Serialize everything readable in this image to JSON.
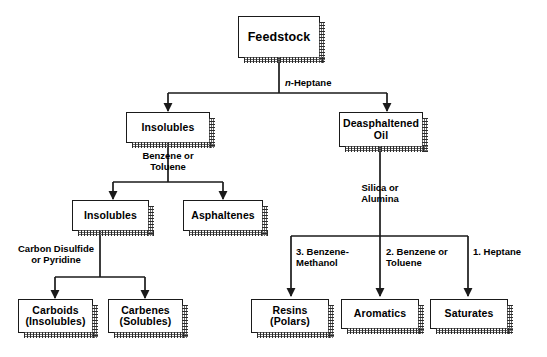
{
  "diagram": {
    "type": "flowchart",
    "background_color": "#ffffff",
    "line_color": "#1a1a1a",
    "nodes": [
      {
        "id": "feedstock",
        "label": "Feedstock"
      },
      {
        "id": "insolubles1",
        "label": "Insolubles"
      },
      {
        "id": "deasphaltened_oil",
        "label": "Deasphaltened\nOil"
      },
      {
        "id": "insolubles2",
        "label": "Insolubles"
      },
      {
        "id": "asphaltenes",
        "label": "Asphaltenes"
      },
      {
        "id": "carboids",
        "label": "Carboids\n(Insolubles)"
      },
      {
        "id": "carbenes",
        "label": "Carbenes\n(Solubles)"
      },
      {
        "id": "resins",
        "label": "Resins\n(Polars)"
      },
      {
        "id": "aromatics",
        "label": "Aromatics"
      },
      {
        "id": "saturates",
        "label": "Saturates"
      }
    ],
    "edge_labels": [
      {
        "id": "n_heptane",
        "italic_prefix": "n",
        "rest": "-Heptane"
      },
      {
        "id": "benzene_toluene1",
        "text": "Benzene or\nToluene"
      },
      {
        "id": "silica_alumina",
        "text": "Silica or\nAlumina"
      },
      {
        "id": "carbon_disulfide",
        "text": "Carbon Disulfide\nor Pyridine"
      },
      {
        "id": "benzene_methanol",
        "text": "3. Benzene-\nMethanol"
      },
      {
        "id": "benzene_toluene2",
        "text": "2. Benzene or\nToluene"
      },
      {
        "id": "heptane",
        "text": "1. Heptane"
      }
    ]
  }
}
